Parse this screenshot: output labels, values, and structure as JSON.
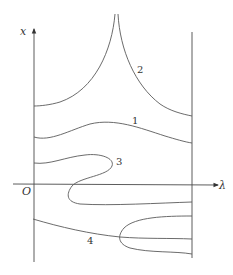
{
  "diagram": {
    "axes": {
      "vertical_label": "x",
      "horizontal_label": "λ",
      "origin_label": "O"
    },
    "curves": [
      {
        "id": "1",
        "label": "1",
        "description": "smooth hump curve spanning the strip"
      },
      {
        "id": "2",
        "label": "2",
        "description": "two branches rising to a cusp at top"
      },
      {
        "id": "3",
        "label": "3",
        "description": "S-shaped curve folding back across the λ axis"
      },
      {
        "id": "4",
        "label": "4",
        "description": "line with a sideways loop (fold) opening to the right"
      }
    ],
    "colors": {
      "stroke": "#5a5a5a",
      "background": "#ffffff"
    }
  }
}
